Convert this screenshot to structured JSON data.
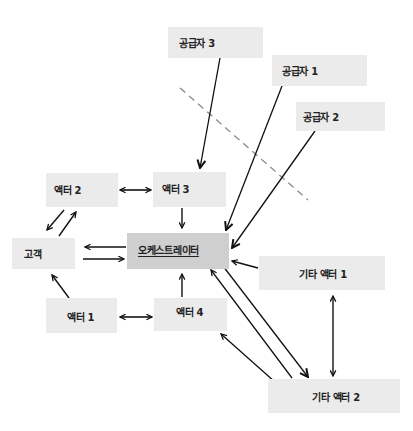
{
  "diagram": {
    "type": "architecture-flow",
    "nodes": {
      "supplier3": {
        "label": "공급자 3"
      },
      "supplier1": {
        "label": "공급자 1"
      },
      "supplier2": {
        "label": "공급자 2"
      },
      "actor2": {
        "label": "액터 2"
      },
      "actor3": {
        "label": "액터 3"
      },
      "customer": {
        "label": "고객"
      },
      "orchestrator": {
        "label": "오케스트레이터"
      },
      "other_actor1": {
        "label": "기타 액터 1"
      },
      "actor1": {
        "label": "액터 1"
      },
      "actor4": {
        "label": "액터 4"
      },
      "other_actor2": {
        "label": "기타 액터 2"
      }
    },
    "edges": [
      {
        "from": "supplier3",
        "to": "actor3",
        "direction": "one-way"
      },
      {
        "from": "supplier1",
        "to": "orchestrator",
        "direction": "one-way"
      },
      {
        "from": "supplier2",
        "to": "orchestrator",
        "direction": "one-way"
      },
      {
        "from": "actor2",
        "to": "actor3",
        "direction": "two-way"
      },
      {
        "from": "actor2",
        "to": "customer",
        "direction": "one-way"
      },
      {
        "from": "customer",
        "to": "actor2",
        "direction": "one-way"
      },
      {
        "from": "actor3",
        "to": "orchestrator",
        "direction": "one-way"
      },
      {
        "from": "orchestrator",
        "to": "customer",
        "direction": "one-way"
      },
      {
        "from": "customer",
        "to": "orchestrator",
        "direction": "one-way"
      },
      {
        "from": "actor1",
        "to": "customer",
        "direction": "one-way"
      },
      {
        "from": "actor1",
        "to": "actor4",
        "direction": "two-way"
      },
      {
        "from": "actor4",
        "to": "orchestrator",
        "direction": "one-way"
      },
      {
        "from": "other_actor1",
        "to": "orchestrator",
        "direction": "one-way"
      },
      {
        "from": "other_actor1",
        "to": "other_actor2",
        "direction": "two-way"
      },
      {
        "from": "orchestrator",
        "to": "other_actor2",
        "direction": "one-way"
      },
      {
        "from": "other_actor2",
        "to": "orchestrator",
        "direction": "one-way"
      },
      {
        "from": "other_actor2",
        "to": "actor4",
        "direction": "one-way"
      }
    ],
    "boundary": {
      "style": "dashed",
      "color": "#8a8a8a"
    },
    "colors": {
      "node_fill": "#ebebeb",
      "orchestrator_fill": "#cfcfcf",
      "arrow": "#111111"
    }
  }
}
